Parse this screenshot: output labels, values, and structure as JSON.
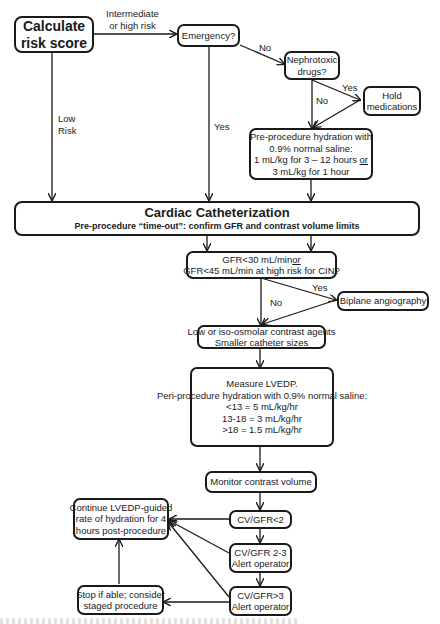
{
  "nodes": {
    "calc": {
      "lines": [
        "Calculate",
        "risk score"
      ]
    },
    "emergency": {
      "lines": [
        "Emergency?"
      ]
    },
    "nephro": {
      "lines": [
        "Nephrotoxic",
        "drugs?"
      ]
    },
    "hold": {
      "lines": [
        "Hold",
        "medications"
      ]
    },
    "prehydr": {
      "lines": [
        "Pre-procedure hydration with",
        "0.9% normal saline:",
        "1 mL/kg for 3 – 12 hours",
        "3 mL/kg for 1 hour"
      ],
      "or": "or"
    },
    "cath": {
      "title": "Cardiac Catheterization",
      "subtitle": "Pre-procedure “time-out”: confirm GFR and contrast volume limits"
    },
    "gfr": {
      "line1": "GFR<30 mL/min",
      "or": "or",
      "line2": "GFR<45 mL/min at high risk for CIN?"
    },
    "biplane": {
      "lines": [
        "Biplane angiography"
      ]
    },
    "contrast": {
      "lines": [
        "Low or iso-osmolar contrast agents",
        "Smaller catheter sizes"
      ]
    },
    "lvedp": {
      "lines": [
        "Measure LVEDP.",
        "Peri-procedure hydration with 0.9% normal saline:",
        "<13 = 5 mL/kg/hr",
        "13-18 = 3 mL/kg/hr",
        ">18 = 1.5 mL/kg/hr"
      ]
    },
    "monitor": {
      "lines": [
        "Monitor contrast volume"
      ]
    },
    "cv1": {
      "lines": [
        "CV/GFR<2"
      ]
    },
    "cv2": {
      "lines": [
        "CV/GFR 2-3",
        "Alert operator"
      ]
    },
    "cv3": {
      "lines": [
        "CV/GFR>3",
        "Alert operator"
      ]
    },
    "cont": {
      "lines": [
        "Continue LVEDP-guided",
        "rate of hydration for 4",
        "hours post-procedure"
      ]
    },
    "stop": {
      "lines": [
        "Stop if able; consider",
        "staged procedure"
      ]
    }
  },
  "edge_labels": {
    "intermediate": [
      "Intermediate",
      "or high risk"
    ],
    "low": [
      "Low",
      "Risk"
    ],
    "emerg_yes": "Yes",
    "emerg_no": "No",
    "nephro_yes": "Yes",
    "nephro_no": "No",
    "gfr_yes": "Yes",
    "gfr_no": "No"
  },
  "colors": {
    "stroke": "#1a1a1a",
    "background": "#ffffff"
  }
}
